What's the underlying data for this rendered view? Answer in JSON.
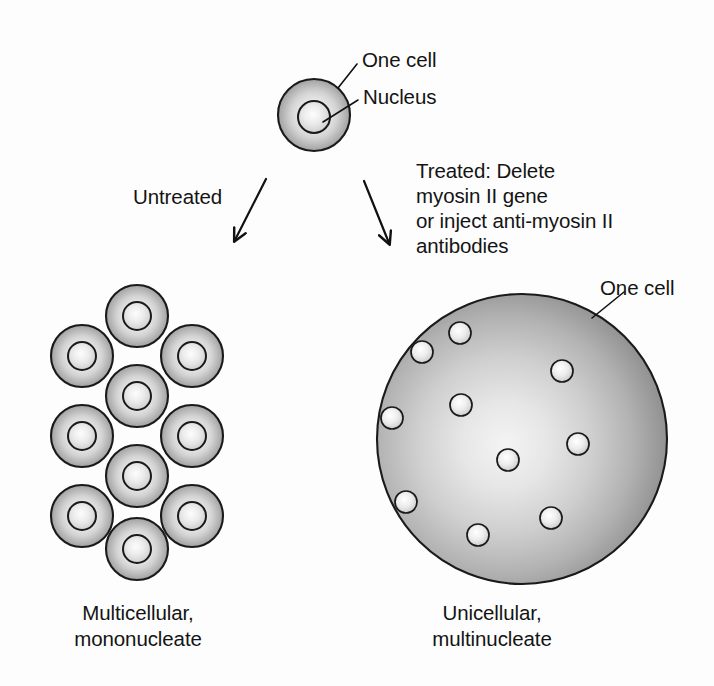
{
  "figure": {
    "background_color": "#fdfdfd",
    "ink_color": "#141414",
    "cell_fill_dark": "#8d8d8d",
    "cell_fill_light": "#f2f2f2",
    "outline_color": "#1a1a1a"
  },
  "labels": {
    "one_cell_top": "One cell",
    "nucleus_top": "Nucleus",
    "untreated": "Untreated",
    "treated_line1": "Treated: Delete",
    "treated_line2": "myosin II gene",
    "treated_line3": "or inject anti-myosin II",
    "treated_line4": "antibodies",
    "one_cell_right": "One cell",
    "caption_left_line1": "Multicellular,",
    "caption_left_line2": "mononucleate",
    "caption_right_line1": "Unicellular,",
    "caption_right_line2": "multinucleate"
  },
  "diagram_data": {
    "type": "diagram",
    "subject": "Effect of myosin II loss on cytokinesis",
    "parent_cell": {
      "cx": 314,
      "cy": 115,
      "r": 36,
      "nucleus": {
        "cx": 314,
        "cy": 117,
        "r": 16
      }
    },
    "arrows": [
      {
        "name": "untreated-arrow",
        "x1": 266,
        "y1": 179,
        "x2": 235,
        "y2": 240
      },
      {
        "name": "treated-arrow",
        "x1": 364,
        "y1": 181,
        "x2": 389,
        "y2": 243
      }
    ],
    "leaders": [
      {
        "name": "one-cell-top-leader",
        "x1": 338,
        "y1": 88,
        "x2": 357,
        "y2": 64
      },
      {
        "name": "nucleus-top-leader",
        "x1": 323,
        "y1": 122,
        "x2": 358,
        "y2": 100
      },
      {
        "name": "one-cell-right-leader",
        "x1": 592,
        "y1": 318,
        "x2": 624,
        "y2": 292
      }
    ],
    "multicellular_cluster": {
      "count": 11,
      "cell_radius": 31,
      "nucleus_radius": 14,
      "cells": [
        {
          "cx": 137,
          "cy": 316
        },
        {
          "cx": 82,
          "cy": 356
        },
        {
          "cx": 192,
          "cy": 356
        },
        {
          "cx": 137,
          "cy": 396
        },
        {
          "cx": 82,
          "cy": 436
        },
        {
          "cx": 192,
          "cy": 436
        },
        {
          "cx": 137,
          "cy": 476
        },
        {
          "cx": 82,
          "cy": 516
        },
        {
          "cx": 192,
          "cy": 516
        },
        {
          "cx": 137,
          "cy": 549
        },
        {
          "cx": 192,
          "cy": 476
        }
      ]
    },
    "multinucleate_cell": {
      "cx": 522,
      "cy": 439,
      "r": 145,
      "nucleus_count": 10,
      "nucleus_radius": 11,
      "nuclei": [
        {
          "cx": 460,
          "cy": 333
        },
        {
          "cx": 422,
          "cy": 352
        },
        {
          "cx": 562,
          "cy": 371
        },
        {
          "cx": 461,
          "cy": 405
        },
        {
          "cx": 392,
          "cy": 418
        },
        {
          "cx": 578,
          "cy": 444
        },
        {
          "cx": 508,
          "cy": 460
        },
        {
          "cx": 406,
          "cy": 502
        },
        {
          "cx": 478,
          "cy": 535
        },
        {
          "cx": 551,
          "cy": 518
        }
      ]
    }
  }
}
